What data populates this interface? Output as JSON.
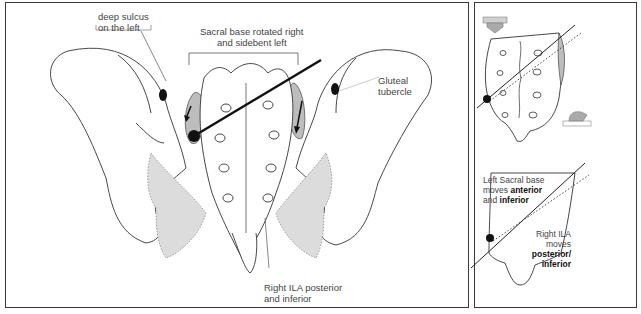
{
  "main_panel": {
    "labels": {
      "deep_sulcus_line1": "deep sulcus",
      "deep_sulcus_line2": "on  the left",
      "sacral_base_line1": "Sacral base rotated right",
      "sacral_base_line2": "and sidebent left",
      "gluteal_line1": "Gluteal",
      "gluteal_line2": "tubercle",
      "right_ila_line1": "Right ILA posterior",
      "right_ila_line2": "and inferior"
    },
    "icons": [
      "pelvis-illustration",
      "sacrum-illustration",
      "axis-line",
      "pivot-dot",
      "motion-arrow-left",
      "motion-arrow-right"
    ]
  },
  "side_panel": {
    "top_figure": {
      "icons": [
        "push-down-arrow-icon",
        "sacrum-outline",
        "axis-line",
        "pivot-dot",
        "push-up-arrow-icon"
      ]
    },
    "bottom_figure": {
      "left_text_line1": "Left Sacral base",
      "left_text_line2_pre": "moves ",
      "left_text_line2_bold": "anterior",
      "left_text_line3_pre": "and ",
      "left_text_line3_bold": "inferior",
      "right_text_line1": "Right ILA",
      "right_text_line2": "moves",
      "right_text_line3_bold": "posterior/",
      "right_text_line4_bold": "inferior"
    }
  },
  "colors": {
    "border": "#3a3a3a",
    "ligament_fill": "#dcdcdc",
    "joint_fill": "#bdbdbd",
    "ink": "#111111"
  }
}
